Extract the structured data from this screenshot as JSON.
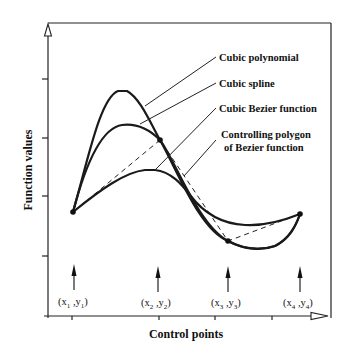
{
  "figure": {
    "y_axis_label": "Function values",
    "x_axis_label": "Control points",
    "legend": [
      {
        "key": "cubic_polynomial",
        "label": "Cubic polynomial"
      },
      {
        "key": "cubic_spline",
        "label": "Cubic spline"
      },
      {
        "key": "cubic_bezier",
        "label": "Cubic Bezier function"
      },
      {
        "key": "control_polygon",
        "label_line1": "Controlling polygon",
        "label_line2": "of Bezier function"
      }
    ],
    "control_points": [
      {
        "x": "x",
        "xsub": "1",
        "y": "y",
        "ysub": "1"
      },
      {
        "x": "x",
        "xsub": "2",
        "y": "y",
        "ysub": "2"
      },
      {
        "x": "x",
        "xsub": "3",
        "y": "y",
        "ysub": "3"
      },
      {
        "x": "x",
        "xsub": "4",
        "y": "y",
        "ysub": "4"
      }
    ],
    "colors": {
      "ink": "#1a1a1a",
      "background": "#ffffff"
    }
  }
}
